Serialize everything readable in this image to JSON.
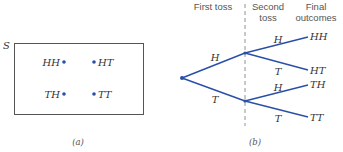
{
  "colors": {
    "accent": "#2a4fa8",
    "box_border": "#555555",
    "text": "#333333"
  },
  "panel_a": {
    "set_label": "S",
    "outcomes": [
      {
        "label": "HH",
        "x": 64,
        "y": 62,
        "label_side": "left"
      },
      {
        "label": "HT",
        "x": 94,
        "y": 62,
        "label_side": "right"
      },
      {
        "label": "TH",
        "x": 64,
        "y": 94,
        "label_side": "left"
      },
      {
        "label": "TT",
        "x": 94,
        "y": 94,
        "label_side": "right"
      }
    ],
    "caption": "(a)"
  },
  "panel_b": {
    "headers": {
      "first_toss": "First toss",
      "second_toss_line1": "Second",
      "second_toss_line2": "toss",
      "final_line1": "Final",
      "final_line2": "outcomes"
    },
    "first_branches": [
      {
        "label": "H"
      },
      {
        "label": "T"
      }
    ],
    "second_branches": [
      {
        "label": "H",
        "outcome": "HH"
      },
      {
        "label": "T",
        "outcome": "HT"
      },
      {
        "label": "H",
        "outcome": "TH"
      },
      {
        "label": "T",
        "outcome": "TT"
      }
    ],
    "caption": "(b)"
  }
}
